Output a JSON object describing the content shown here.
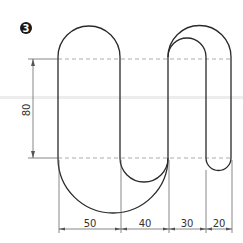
{
  "figure": {
    "number_badge": "3"
  },
  "dimensions": {
    "vertical": {
      "label": "80"
    },
    "horizontal": [
      {
        "label": "50"
      },
      {
        "label": "40"
      },
      {
        "label": "30"
      },
      {
        "label": "20"
      }
    ]
  },
  "colors": {
    "outline": "#2a2a2a",
    "dimension": "#555555",
    "centerline": "#888888",
    "background": "#ffffff"
  }
}
